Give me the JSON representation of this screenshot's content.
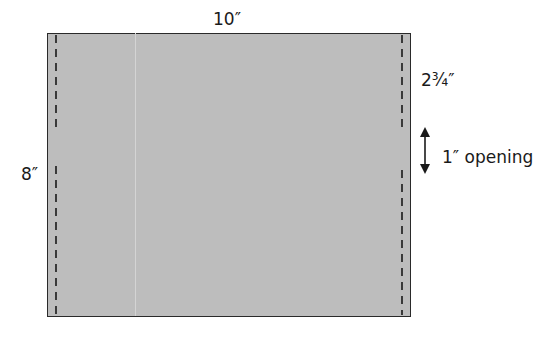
{
  "diagram": {
    "type": "sewing-pattern-panel",
    "panel": {
      "width_label": "10″",
      "height_label": "8″",
      "fill_color": "#bdbdbd",
      "border_color": "#2a2a2a"
    },
    "stitch_lines": {
      "style": "dashed",
      "color": "#1a1a1a",
      "left": {
        "x": 56,
        "segments": [
          [
            35,
            128
          ],
          [
            166,
            315
          ]
        ]
      },
      "right": {
        "x": 402,
        "segments": [
          [
            35,
            127
          ],
          [
            170,
            315
          ]
        ]
      }
    },
    "annotations": {
      "seam_length_label": "2¾″",
      "opening_label": "1″ opening",
      "opening_arrow": {
        "x": 425,
        "y_top": 128,
        "y_bottom": 173,
        "direction": "double-vertical"
      }
    }
  }
}
